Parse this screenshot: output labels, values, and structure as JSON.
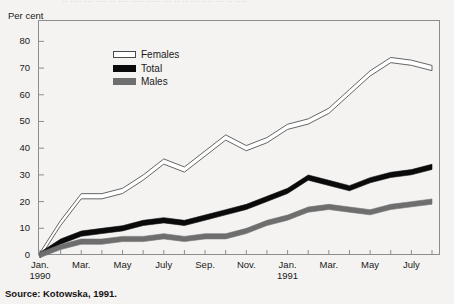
{
  "top_bleed_text": "·· ···· ··· ···· ·· ···· ···· ····· ··· ·· ·· ··· ···· ··· ·· ····",
  "axis": {
    "ylabel": "Per cent",
    "yticks": [
      "0",
      "10",
      "20",
      "30",
      "40",
      "50",
      "60",
      "70",
      "80"
    ],
    "xticks": [
      {
        "label": "Jan.",
        "year": "1990"
      },
      {
        "label": "Mar.",
        "year": ""
      },
      {
        "label": "May",
        "year": ""
      },
      {
        "label": "July",
        "year": ""
      },
      {
        "label": "Sep.",
        "year": ""
      },
      {
        "label": "Nov.",
        "year": ""
      },
      {
        "label": "Jan.",
        "year": "1991"
      },
      {
        "label": "Mar.",
        "year": ""
      },
      {
        "label": "May",
        "year": ""
      },
      {
        "label": "July",
        "year": ""
      }
    ]
  },
  "legend": {
    "items": [
      {
        "label": "Females",
        "color": "#ffffff",
        "swatch": "sw-females"
      },
      {
        "label": "Total",
        "color": "#0a0a0a",
        "swatch": "sw-total"
      },
      {
        "label": "Males",
        "color": "#6e6e6e",
        "swatch": "sw-males"
      }
    ]
  },
  "source": "Source: Kotowska, 1991.",
  "chart_data": {
    "type": "line",
    "title": "",
    "xlabel": "",
    "ylabel": "Per cent",
    "ylim": [
      0,
      88
    ],
    "yticks": [
      0,
      10,
      20,
      30,
      40,
      50,
      60,
      70,
      80
    ],
    "grid": false,
    "legend_position": "inside-top-left",
    "x": [
      "Jan. 1990",
      "Feb. 1990",
      "Mar. 1990",
      "Apr. 1990",
      "May 1990",
      "June 1990",
      "July 1990",
      "Aug. 1990",
      "Sep. 1990",
      "Oct. 1990",
      "Nov. 1990",
      "Dec. 1990",
      "Jan. 1991",
      "Feb. 1991",
      "Mar. 1991",
      "Apr. 1991",
      "May 1991",
      "June 1991",
      "July 1991",
      "Aug. 1991"
    ],
    "series": [
      {
        "name": "Females",
        "color": "#ffffff",
        "style": "outlined-band",
        "values": [
          0,
          12,
          22,
          22,
          24,
          29,
          35,
          32,
          38,
          44,
          40,
          43,
          48,
          50,
          54,
          61,
          68,
          73,
          72,
          70
        ]
      },
      {
        "name": "Total",
        "color": "#0a0a0a",
        "style": "filled-band",
        "values": [
          0,
          5,
          8,
          9,
          10,
          12,
          13,
          12,
          14,
          16,
          18,
          21,
          24,
          29,
          27,
          25,
          28,
          30,
          31,
          33
        ]
      },
      {
        "name": "Males",
        "color": "#6e6e6e",
        "style": "filled-band",
        "values": [
          0,
          3,
          5,
          5,
          6,
          6,
          7,
          6,
          7,
          7,
          9,
          12,
          14,
          17,
          18,
          17,
          16,
          18,
          19,
          20
        ]
      }
    ]
  }
}
